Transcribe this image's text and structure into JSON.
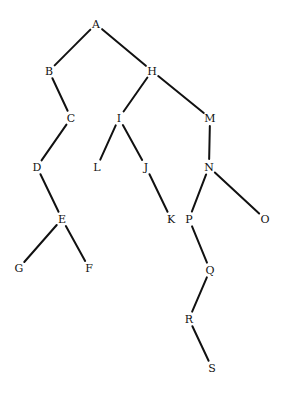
{
  "diagram": {
    "type": "tree",
    "nodes": [
      {
        "id": "A",
        "label": "A",
        "x": 96,
        "y": 24
      },
      {
        "id": "B",
        "label": "B",
        "x": 49,
        "y": 71
      },
      {
        "id": "H",
        "label": "H",
        "x": 152,
        "y": 71
      },
      {
        "id": "C",
        "label": "C",
        "x": 71,
        "y": 118
      },
      {
        "id": "I",
        "label": "I",
        "x": 119,
        "y": 118
      },
      {
        "id": "M",
        "label": "M",
        "x": 210,
        "y": 118
      },
      {
        "id": "D",
        "label": "D",
        "x": 37,
        "y": 167
      },
      {
        "id": "L",
        "label": "L",
        "x": 97,
        "y": 167
      },
      {
        "id": "J",
        "label": "J",
        "x": 146,
        "y": 167
      },
      {
        "id": "N",
        "label": "N",
        "x": 209,
        "y": 167
      },
      {
        "id": "E",
        "label": "E",
        "x": 62,
        "y": 219
      },
      {
        "id": "K",
        "label": "K",
        "x": 171,
        "y": 219
      },
      {
        "id": "P",
        "label": "P",
        "x": 189,
        "y": 219
      },
      {
        "id": "O",
        "label": "O",
        "x": 265,
        "y": 219
      },
      {
        "id": "G",
        "label": "G",
        "x": 19,
        "y": 268
      },
      {
        "id": "F",
        "label": "F",
        "x": 89,
        "y": 268
      },
      {
        "id": "Q",
        "label": "Q",
        "x": 210,
        "y": 270
      },
      {
        "id": "R",
        "label": "R",
        "x": 189,
        "y": 319
      },
      {
        "id": "S",
        "label": "S",
        "x": 212,
        "y": 368
      }
    ],
    "edges": [
      [
        "A",
        "B"
      ],
      [
        "A",
        "H"
      ],
      [
        "B",
        "C"
      ],
      [
        "C",
        "D"
      ],
      [
        "D",
        "E"
      ],
      [
        "E",
        "G"
      ],
      [
        "E",
        "F"
      ],
      [
        "H",
        "I"
      ],
      [
        "H",
        "M"
      ],
      [
        "I",
        "L"
      ],
      [
        "I",
        "J"
      ],
      [
        "J",
        "K"
      ],
      [
        "M",
        "N"
      ],
      [
        "N",
        "P"
      ],
      [
        "N",
        "O"
      ],
      [
        "P",
        "Q"
      ],
      [
        "Q",
        "R"
      ],
      [
        "R",
        "S"
      ]
    ]
  }
}
